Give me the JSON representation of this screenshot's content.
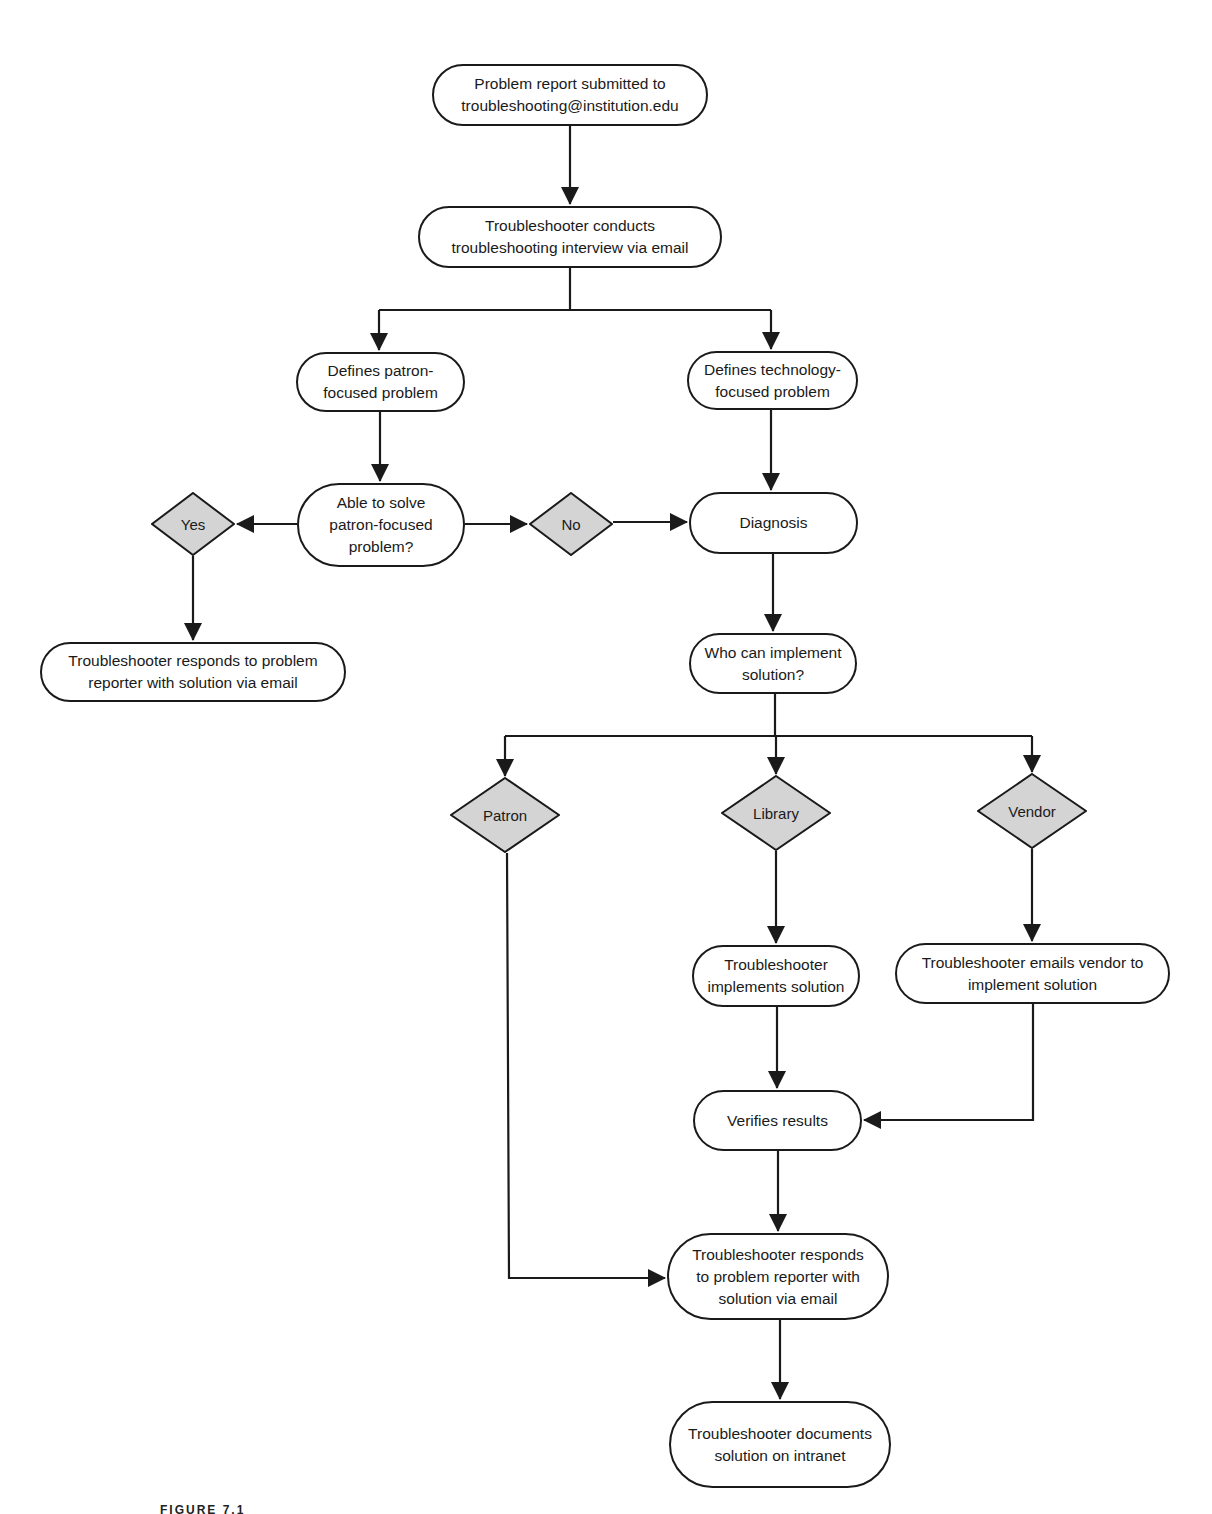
{
  "diagram": {
    "type": "flowchart",
    "fill_colors": {
      "process": "#ffffff",
      "decision": "#d4d4d4",
      "stroke": "#1a1a1a"
    },
    "nodes": {
      "report_submitted": "Problem report submitted to\ntroubleshooting@institution.edu",
      "interview": "Troubleshooter conducts\ntroubleshooting interview via email",
      "patron_problem": "Defines patron-\nfocused problem",
      "technology_problem": "Defines technology-\nfocused problem",
      "able_to_solve": "Able to solve\npatron-focused\nproblem?",
      "yes": "Yes",
      "no": "No",
      "diagnosis": "Diagnosis",
      "responds_left": "Troubleshooter responds to problem\nreporter with solution via email",
      "who_can_implement": "Who can implement\nsolution?",
      "patron": "Patron",
      "library": "Library",
      "vendor": "Vendor",
      "implements": "Troubleshooter\nimplements solution",
      "emails_vendor": "Troubleshooter emails vendor to\nimplement solution",
      "verifies": "Verifies results",
      "responds_bottom": "Troubleshooter responds\nto problem reporter with\nsolution via email",
      "documents": "Troubleshooter documents\nsolution on intranet"
    },
    "edges": [
      [
        "report_submitted",
        "interview"
      ],
      [
        "interview",
        "patron_problem"
      ],
      [
        "interview",
        "technology_problem"
      ],
      [
        "patron_problem",
        "able_to_solve"
      ],
      [
        "technology_problem",
        "diagnosis"
      ],
      [
        "able_to_solve",
        "yes"
      ],
      [
        "able_to_solve",
        "no"
      ],
      [
        "no",
        "diagnosis"
      ],
      [
        "yes",
        "responds_left"
      ],
      [
        "diagnosis",
        "who_can_implement"
      ],
      [
        "who_can_implement",
        "patron"
      ],
      [
        "who_can_implement",
        "library"
      ],
      [
        "who_can_implement",
        "vendor"
      ],
      [
        "library",
        "implements"
      ],
      [
        "vendor",
        "emails_vendor"
      ],
      [
        "implements",
        "verifies"
      ],
      [
        "emails_vendor",
        "verifies"
      ],
      [
        "patron",
        "responds_bottom"
      ],
      [
        "verifies",
        "responds_bottom"
      ],
      [
        "responds_bottom",
        "documents"
      ]
    ],
    "caption": "FIGURE 7.1"
  }
}
